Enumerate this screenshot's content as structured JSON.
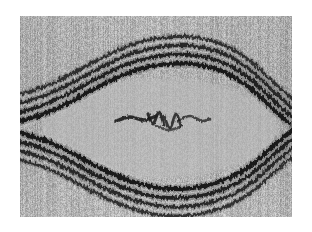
{
  "image": {
    "kind": "electron-micrograph",
    "subject": "multilamellar-membrane-lens-structure",
    "alt_text": "Grayscale transmission electron micrograph of a lens-shaped structure bounded above and below by multiple parallel dark lamellar bands, with a lighter finely-striated interior and a dark irregular zigzag inclusion at the center.",
    "canvas": {
      "page_width": 312,
      "page_height": 232,
      "frame_left": 20,
      "frame_top": 16,
      "frame_width": 272,
      "frame_height": 201
    },
    "palette": {
      "page_background": "#ffffff",
      "matrix_light": "#bdbdbd",
      "matrix_mid": "#a8a8a8",
      "interior_light": "#b9b9b9",
      "lamella_dark": "#141414",
      "lamella_mid": "#3c3c3c",
      "lamella_gap": "#cfcfcf",
      "inclusion_dark": "#1b1b1b",
      "striation_dark": "#8f8f8f",
      "striation_light": "#cecece"
    },
    "texture": {
      "type": "fine-vertical-striation",
      "stripe_period_px": 2,
      "noise_amount": 0.17,
      "grain_seed": 20240517
    }
  },
  "structures": {
    "upper_lamellae": {
      "name": "upper-lamellar-band",
      "band_count": 4,
      "description": "Arched stack of dark lamellae rising to an apex near the horizontal center and descending toward both lateral margins.",
      "path_points": [
        [
          -12,
          108
        ],
        [
          18,
          100
        ],
        [
          46,
          88
        ],
        [
          76,
          72
        ],
        [
          108,
          57
        ],
        [
          140,
          49
        ],
        [
          172,
          48
        ],
        [
          204,
          56
        ],
        [
          230,
          72
        ],
        [
          252,
          92
        ],
        [
          270,
          108
        ],
        [
          284,
          118
        ]
      ],
      "band_offsets": [
        0,
        9,
        18,
        27
      ],
      "band_widths": [
        4.2,
        3.6,
        3.4,
        3.0
      ]
    },
    "lower_lamellae": {
      "name": "lower-lamellar-band",
      "band_count": 4,
      "description": "Mirror-image stack of dark lamellae bowing downward to a trough near the horizontal center and rising toward both lateral margins.",
      "path_points": [
        [
          -12,
          114
        ],
        [
          18,
          122
        ],
        [
          46,
          134
        ],
        [
          76,
          150
        ],
        [
          108,
          164
        ],
        [
          140,
          172
        ],
        [
          172,
          172
        ],
        [
          204,
          164
        ],
        [
          230,
          150
        ],
        [
          252,
          131
        ],
        [
          270,
          116
        ],
        [
          284,
          106
        ]
      ],
      "band_offsets": [
        0,
        9,
        18,
        27
      ],
      "band_widths": [
        4.2,
        3.6,
        3.4,
        3.0
      ]
    },
    "interior_lumen": {
      "name": "interior-lumen",
      "description": "Lens-shaped lighter interior enclosed by the upper and lower lamellar stacks.",
      "center_x": 140,
      "center_y": 112,
      "half_width": 118,
      "half_height": 50
    },
    "median_line": {
      "name": "median-cleft-line",
      "description": "Thin pale horizontal line crossing the full width of the field at the vertical midpoint.",
      "y": 110,
      "thickness": 1.1,
      "color": "#d6d6d6"
    },
    "central_inclusion": {
      "name": "central-zigzag-inclusion",
      "description": "Dark irregular zigzag / scribble-like dense inclusion lying along the median line in the middle of the lumen.",
      "bounds": {
        "x": 96,
        "y": 94,
        "width": 92,
        "height": 24
      },
      "strokes": [
        [
          [
            96,
            105
          ],
          [
            110,
            101
          ],
          [
            124,
            104
          ],
          [
            136,
            100
          ]
        ],
        [
          [
            128,
            98
          ],
          [
            133,
            108
          ],
          [
            139,
            96
          ],
          [
            144,
            109
          ]
        ],
        [
          [
            144,
            100
          ],
          [
            150,
            112
          ],
          [
            156,
            98
          ],
          [
            161,
            110
          ]
        ],
        [
          [
            158,
            104
          ],
          [
            170,
            100
          ],
          [
            182,
            105
          ],
          [
            190,
            103
          ]
        ],
        [
          [
            136,
            110
          ],
          [
            148,
            114
          ],
          [
            160,
            111
          ]
        ]
      ]
    },
    "left_waist": {
      "name": "left-waist-convergence",
      "description": "Point near the left margin where the upper and lower lamellar stacks converge and overlap.",
      "x": 6,
      "y": 111
    },
    "right_waist": {
      "name": "right-waist-convergence",
      "description": "Point near the right margin where the upper and lower lamellar stacks converge and overlap.",
      "x": 268,
      "y": 111
    }
  }
}
